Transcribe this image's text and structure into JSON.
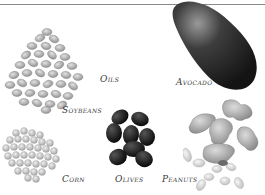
{
  "figure": {
    "items": [
      {
        "id": "oils",
        "label": "Oils"
      },
      {
        "id": "avocado",
        "label": "Avocado"
      },
      {
        "id": "soybeans",
        "label": "Soybeans"
      },
      {
        "id": "corn",
        "label": "Corn"
      },
      {
        "id": "olives",
        "label": "Olives"
      },
      {
        "id": "peanuts",
        "label": "Peanuts"
      }
    ]
  },
  "colors": {
    "rule": "#8a8a8a",
    "label": "#3a3a3a",
    "soybean": "#b9b9b9",
    "corn": "#c8c8c8",
    "olive": "#1e1e1e",
    "avocado": "#2b2b2b",
    "peanut": "#a9a9a9"
  }
}
